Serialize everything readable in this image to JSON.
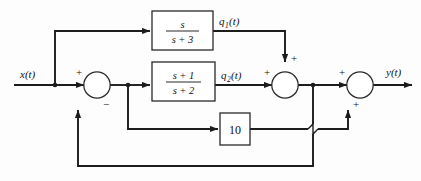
{
  "figure": {
    "kind": "control-system-block-diagram",
    "title": "",
    "background_color": "#fdfdfd",
    "line_color": "#1c1c1c"
  },
  "signals": {
    "input": "x(t)",
    "output": "y(t)",
    "q1": "q",
    "q1_sub": "1",
    "q1_tail": "(t)",
    "q2": "q",
    "q2_sub": "2",
    "q2_tail": "(t)"
  },
  "blocks": [
    {
      "id": "block-top",
      "name": "transfer-function-s-over-s-plus-3",
      "numerator": "s",
      "denominator": "s + 3",
      "display": "s/(s+3)"
    },
    {
      "id": "block-middle",
      "name": "transfer-function-s-plus-1-over-s-plus-2",
      "numerator": "s + 1",
      "denominator": "s + 2",
      "display": "(s+1)/(s+2)"
    },
    {
      "id": "block-gain",
      "name": "gain-block-10",
      "value": "10",
      "display": "10"
    }
  ],
  "summers": [
    {
      "id": "summer-1",
      "name": "summing-junction-input",
      "signs": {
        "left": "+",
        "bottom": "−"
      }
    },
    {
      "id": "summer-2",
      "name": "summing-junction-middle",
      "signs": {
        "left": "+",
        "top": "+"
      }
    },
    {
      "id": "summer-3",
      "name": "summing-junction-output",
      "signs": {
        "left": "+",
        "bottom": "+"
      }
    }
  ],
  "signs": {
    "plus": "+",
    "minus": "−"
  }
}
